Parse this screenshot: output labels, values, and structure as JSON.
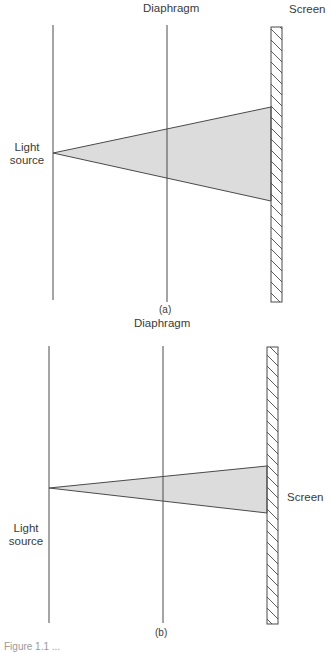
{
  "panels": [
    {
      "id": "a",
      "panel_label": "(a)",
      "labels": {
        "diaphragm": "Diaphragm",
        "screen": "Screen",
        "light_source_line1": "Light",
        "light_source_line2": "source"
      },
      "geometry": {
        "source_line_x": 53,
        "diaphragm_x": 167,
        "screen_x": 271,
        "screen_width": 11,
        "top": 25,
        "bottom": 302,
        "apex": [
          53,
          153
        ],
        "beam_top": [
          271,
          107
        ],
        "beam_bottom": [
          271,
          201
        ]
      }
    },
    {
      "id": "b",
      "panel_label": "(b)",
      "labels": {
        "diaphragm": "Diaphragm",
        "screen": "Screen",
        "light_source_line1": "Light",
        "light_source_line2": "source"
      },
      "geometry": {
        "source_line_x": 49,
        "diaphragm_x": 163,
        "screen_x": 267,
        "screen_width": 11,
        "top": 346,
        "bottom": 624,
        "apex": [
          49,
          488
        ],
        "beam_top": [
          267,
          466
        ],
        "beam_bottom": [
          267,
          513
        ]
      }
    }
  ],
  "colors": {
    "line": "#4a4a4a",
    "beam_fill": "#dcdcdc",
    "hatch": "#4a4a4a"
  },
  "caption": "Figure 1.1  ..."
}
